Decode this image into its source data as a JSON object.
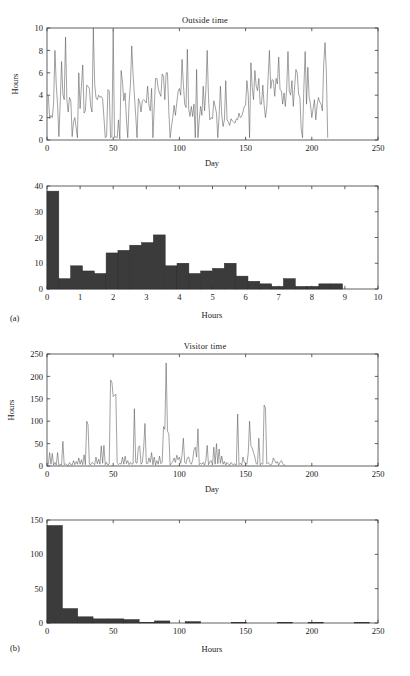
{
  "figure": {
    "width": 410,
    "height": 676,
    "background": "#ffffff",
    "line_color": "#555555",
    "bar_color": "#3b3b3b",
    "axis_color": "#3a3a3a",
    "subfigure_labels": [
      {
        "text": "(a)",
        "x": 10,
        "y": 318
      },
      {
        "text": "(b)",
        "x": 10,
        "y": 643
      }
    ]
  },
  "chart_data": [
    {
      "id": "outside-time-series",
      "type": "line",
      "title": "Outside time",
      "xlabel": "Day",
      "ylabel": "Hours",
      "xlim": [
        0,
        250
      ],
      "ylim": [
        0,
        10
      ],
      "xticks": [
        0,
        50,
        100,
        150,
        200,
        250
      ],
      "yticks": [
        0,
        2,
        4,
        6,
        8,
        10
      ],
      "grid": false,
      "legend": null,
      "n_points": 221,
      "x": [
        1,
        2,
        3,
        4,
        5,
        6,
        7,
        8,
        9,
        10,
        11,
        12,
        13,
        14,
        15,
        16,
        17,
        18,
        19,
        20,
        21,
        22,
        23,
        24,
        25,
        26,
        27,
        28,
        29,
        30,
        31,
        32,
        33,
        34,
        35,
        36,
        37,
        38,
        39,
        40,
        41,
        42,
        43,
        44,
        45,
        46,
        47,
        48,
        49,
        50,
        51,
        52,
        53,
        54,
        55,
        56,
        57,
        58,
        59,
        60,
        61,
        62,
        63,
        64,
        65,
        66,
        67,
        68,
        69,
        70,
        71,
        72,
        73,
        74,
        75,
        76,
        77,
        78,
        79,
        80,
        81,
        82,
        83,
        84,
        85,
        86,
        87,
        88,
        89,
        90,
        91,
        92,
        93,
        94,
        95,
        96,
        97,
        98,
        99,
        100,
        101,
        102,
        103,
        104,
        105,
        106,
        107,
        108,
        109,
        110,
        111,
        112,
        113,
        114,
        115,
        116,
        117,
        118,
        119,
        120,
        121,
        122,
        123,
        124,
        125,
        126,
        127,
        128,
        129,
        130,
        131,
        132,
        133,
        134,
        135,
        136,
        137,
        138,
        139,
        140,
        141,
        142,
        143,
        144,
        145,
        146,
        147,
        148,
        149,
        150,
        151,
        152,
        153,
        154,
        155,
        156,
        157,
        158,
        159,
        160,
        161,
        162,
        163,
        164,
        165,
        166,
        167,
        168,
        169,
        170,
        171,
        172,
        173,
        174,
        175,
        176,
        177,
        178,
        179,
        180,
        181,
        182,
        183,
        184,
        185,
        186,
        187,
        188,
        189,
        190,
        191,
        192,
        193,
        194,
        195,
        196,
        197,
        198,
        199,
        200,
        201,
        202,
        203,
        204,
        205,
        206,
        207,
        208,
        209,
        210,
        211,
        212,
        213,
        214,
        215,
        216,
        217,
        218,
        219,
        220,
        221
      ],
      "y": [
        4.0,
        1.9,
        2.2,
        2.0,
        3.3,
        8.0,
        4.9,
        3.1,
        0.3,
        3.4,
        7.0,
        4.1,
        3.6,
        9.2,
        3.6,
        2.5,
        3.8,
        3.5,
        0.3,
        1.6,
        2.0,
        1.1,
        0.2,
        6.0,
        2.8,
        4.8,
        6.7,
        2.4,
        2.6,
        4.9,
        4.8,
        4.6,
        3.0,
        2.5,
        10.0,
        5.0,
        3.8,
        3.6,
        4.0,
        3.8,
        3.9,
        3.7,
        2.0,
        0.2,
        0.3,
        4.5,
        4.4,
        0.2,
        0.3,
        9.8,
        0.2,
        0.3,
        0.2,
        1.8,
        0.1,
        6.2,
        5.2,
        3.5,
        4.2,
        1.8,
        0.2,
        3.3,
        4.9,
        8.4,
        5.9,
        4.0,
        2.2,
        0.2,
        3.7,
        3.4,
        2.5,
        3.5,
        3.6,
        3.5,
        3.3,
        4.8,
        3.1,
        2.6,
        4.6,
        0.2,
        2.9,
        5.5,
        5.5,
        4.6,
        4.2,
        3.9,
        5.9,
        5.7,
        3.6,
        6.0,
        6.0,
        2.6,
        0.2,
        1.2,
        2.0,
        3.1,
        2.2,
        3.3,
        4.3,
        4.6,
        4.0,
        7.2,
        5.0,
        3.2,
        2.9,
        8.1,
        2.8,
        2.1,
        3.0,
        2.1,
        3.2,
        0.2,
        6.3,
        0.2,
        1.8,
        3.0,
        2.2,
        4.8,
        2.6,
        4.5,
        8.0,
        3.7,
        1.8,
        2.0,
        1.9,
        3.5,
        3.0,
        2.4,
        0.2,
        2.2,
        4.8,
        2.2,
        1.2,
        1.8,
        5.3,
        1.8,
        1.6,
        1.3,
        1.9,
        1.7,
        1.6,
        1.5,
        1.9,
        1.8,
        2.4,
        2.0,
        2.1,
        2.5,
        3.0,
        3.1,
        5.3,
        4.0,
        0.2,
        6.9,
        4.7,
        3.6,
        6.2,
        4.8,
        4.4,
        5.5,
        3.2,
        3.2,
        4.9,
        3.1,
        2.0,
        2.9,
        5.6,
        8.0,
        4.6,
        5.4,
        5.3,
        3.9,
        5.5,
        5.0,
        7.4,
        4.5,
        4.4,
        3.2,
        4.2,
        3.0,
        4.5,
        7.9,
        4.4,
        4.0,
        5.3,
        3.0,
        4.7,
        6.3,
        6.0,
        4.1,
        3.8,
        1.0,
        0.2,
        4.7,
        7.9,
        3.2,
        6.5,
        3.8,
        3.2,
        2.0,
        2.8,
        3.6,
        1.8,
        3.1,
        3.8,
        3.4,
        3.2,
        2.6,
        6.8,
        8.7,
        6.0,
        0.2
      ]
    },
    {
      "id": "outside-time-histogram",
      "type": "bar",
      "title": "",
      "xlabel": "Hours",
      "ylabel": "",
      "xlim": [
        0,
        10
      ],
      "ylim": [
        0,
        40
      ],
      "xticks": [
        0,
        1,
        2,
        3,
        4,
        5,
        6,
        7,
        8,
        9,
        10
      ],
      "yticks": [
        0,
        10,
        20,
        30,
        40
      ],
      "grid": false,
      "bin_width": 0.3571,
      "bin_left_edges": [
        0.0,
        0.357,
        0.714,
        1.071,
        1.429,
        1.786,
        2.143,
        2.5,
        2.857,
        3.214,
        3.571,
        3.929,
        4.286,
        4.643,
        5.0,
        5.357,
        5.714,
        6.071,
        6.429,
        6.786,
        7.143,
        7.5,
        7.857,
        8.214,
        8.571,
        8.929,
        9.286,
        9.643
      ],
      "values": [
        38,
        4,
        9,
        7,
        6,
        14,
        15,
        17,
        18,
        21,
        9,
        10,
        6,
        7,
        8,
        10,
        5,
        3,
        2,
        1,
        4,
        1,
        1,
        2,
        2,
        0,
        0,
        0
      ]
    },
    {
      "id": "visitor-time-series",
      "type": "line",
      "title": "Visitor time",
      "xlabel": "Day",
      "ylabel": "Hours",
      "xlim": [
        0,
        250
      ],
      "ylim": [
        0,
        250
      ],
      "xticks": [
        0,
        50,
        100,
        150,
        200,
        250
      ],
      "yticks": [
        0,
        50,
        100,
        150,
        200,
        250
      ],
      "grid": false,
      "legend": null,
      "n_points": 221,
      "x": [
        1,
        2,
        3,
        4,
        5,
        6,
        7,
        8,
        9,
        10,
        11,
        12,
        13,
        14,
        15,
        16,
        17,
        18,
        19,
        20,
        21,
        22,
        23,
        24,
        25,
        26,
        27,
        28,
        29,
        30,
        31,
        32,
        33,
        34,
        35,
        36,
        37,
        38,
        39,
        40,
        41,
        42,
        43,
        44,
        45,
        46,
        47,
        48,
        49,
        50,
        51,
        52,
        53,
        54,
        55,
        56,
        57,
        58,
        59,
        60,
        61,
        62,
        63,
        64,
        65,
        66,
        67,
        68,
        69,
        70,
        71,
        72,
        73,
        74,
        75,
        76,
        77,
        78,
        79,
        80,
        81,
        82,
        83,
        84,
        85,
        86,
        87,
        88,
        89,
        90,
        91,
        92,
        93,
        94,
        95,
        96,
        97,
        98,
        99,
        100,
        101,
        102,
        103,
        104,
        105,
        106,
        107,
        108,
        109,
        110,
        111,
        112,
        113,
        114,
        115,
        116,
        117,
        118,
        119,
        120,
        121,
        122,
        123,
        124,
        125,
        126,
        127,
        128,
        129,
        130,
        131,
        132,
        133,
        134,
        135,
        136,
        137,
        138,
        139,
        140,
        141,
        142,
        143,
        144,
        145,
        146,
        147,
        148,
        149,
        150,
        151,
        152,
        153,
        154,
        155,
        156,
        157,
        158,
        159,
        160,
        161,
        162,
        163,
        164,
        165,
        166,
        167,
        168,
        169,
        170,
        171,
        172,
        173,
        174,
        175,
        176,
        177,
        178,
        179,
        180,
        181,
        182,
        183,
        184,
        185,
        186,
        187,
        188,
        189,
        190,
        191,
        192,
        193,
        194,
        195,
        196,
        197,
        198,
        199,
        200,
        201,
        202,
        203,
        204,
        205,
        206,
        207,
        208,
        209,
        210,
        211,
        212,
        213,
        214,
        215,
        216,
        217,
        218,
        219,
        220,
        221
      ],
      "y": [
        3,
        30,
        4,
        28,
        2,
        8,
        2,
        30,
        1,
        4,
        2,
        55,
        3,
        5,
        2,
        1,
        8,
        3,
        2,
        12,
        3,
        10,
        4,
        18,
        4,
        14,
        3,
        25,
        3,
        100,
        92,
        4,
        3,
        8,
        6,
        3,
        20,
        5,
        15,
        4,
        45,
        6,
        46,
        3,
        8,
        2,
        5,
        192,
        187,
        155,
        158,
        160,
        8,
        3,
        6,
        4,
        20,
        4,
        22,
        5,
        12,
        3,
        8,
        4,
        5,
        128,
        8,
        6,
        42,
        45,
        4,
        8,
        40,
        95,
        6,
        5,
        18,
        8,
        30,
        3,
        20,
        2,
        12,
        4,
        22,
        5,
        8,
        88,
        82,
        230,
        78,
        72,
        2,
        6,
        10,
        18,
        8,
        24,
        14,
        20,
        6,
        25,
        62,
        8,
        5,
        18,
        20,
        8,
        4,
        12,
        36,
        42,
        20,
        83,
        3,
        6,
        4,
        8,
        2,
        12,
        46,
        3,
        10,
        12,
        2,
        42,
        4,
        50,
        5,
        38,
        6,
        22,
        4,
        10,
        2,
        8,
        4,
        2,
        8,
        4,
        3,
        5,
        2,
        116,
        3,
        6,
        2,
        20,
        8,
        6,
        4,
        30,
        100,
        45,
        40,
        30,
        20,
        5,
        4,
        62,
        2,
        6,
        4,
        136,
        130,
        5,
        8,
        4,
        2,
        6,
        18,
        12,
        6,
        10,
        2,
        8,
        12,
        6,
        2,
        1
      ]
    },
    {
      "id": "visitor-time-histogram",
      "type": "bar",
      "title": "",
      "xlabel": "Hours",
      "ylabel": "",
      "xlim": [
        0,
        250
      ],
      "ylim": [
        0,
        150
      ],
      "xticks": [
        0,
        50,
        100,
        150,
        200,
        250
      ],
      "yticks": [
        0,
        50,
        100,
        150
      ],
      "grid": false,
      "bin_width": 11.6,
      "bin_left_edges": [
        0,
        11.6,
        23.2,
        34.8,
        46.4,
        58,
        69.6,
        81.2,
        92.8,
        104.4,
        116,
        127.6,
        139.2,
        150.8,
        162.4,
        174,
        185.6,
        197.2,
        208.8,
        220.4,
        232
      ],
      "values": [
        142,
        21,
        9,
        6,
        6,
        5,
        1,
        3,
        0,
        2,
        0,
        0,
        1,
        0,
        0,
        1,
        0,
        1,
        0,
        0,
        1
      ]
    }
  ]
}
